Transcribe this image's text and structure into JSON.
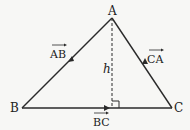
{
  "diagram": {
    "vertices": [
      {
        "label": "A",
        "x": 112,
        "y": 18
      },
      {
        "label": "B",
        "x": 22,
        "y": 108
      },
      {
        "label": "C",
        "x": 172,
        "y": 108
      }
    ],
    "edges": [
      {
        "from": "A",
        "to": "B",
        "vector_label": "AB"
      },
      {
        "from": "B",
        "to": "C",
        "vector_label": "BC"
      },
      {
        "from": "C",
        "to": "A",
        "vector_label": "CA"
      }
    ],
    "height": {
      "label": "h",
      "foot_x": 112,
      "style": "dashed"
    },
    "colors": {
      "line": "#2a2a2a",
      "background": "#f7f7f5"
    }
  }
}
